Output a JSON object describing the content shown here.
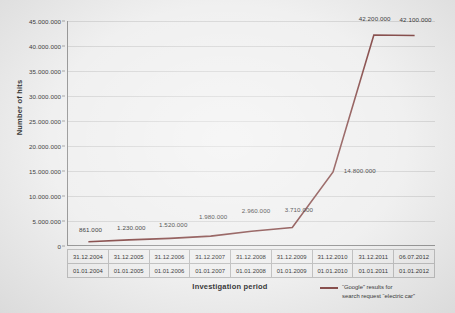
{
  "chart_data": {
    "type": "line",
    "title": "",
    "xlabel": "Investigation period",
    "ylabel": "Number of hits",
    "ylim": [
      0,
      45000000
    ],
    "ytick_step": 5000000,
    "grid": true,
    "legend_position": "bottom-right",
    "line_color": "#7b3a38",
    "categories": [
      "31.12.2004 / 01.01.2004",
      "31.12.2005 / 01.01.2005",
      "31.12.2006 / 01.01.2006",
      "31.12.2007 / 01.01.2007",
      "31.12.2008 / 01.01.2008",
      "31.12.2009 / 01.01.2009",
      "31.12.2010 / 01.01.2010",
      "31.12.2011 / 01.01.2011",
      "06.07.2012 / 01.01.2012"
    ],
    "category_rows": {
      "end_dates": [
        "31.12.2004",
        "31.12.2005",
        "31.12.2006",
        "31.12.2007",
        "31.12.2008",
        "31.12.2009",
        "31.12.2010",
        "31.12.2011",
        "06.07.2012"
      ],
      "start_dates": [
        "01.01.2004",
        "01.01.2005",
        "01.01.2006",
        "01.01.2007",
        "01.01.2008",
        "01.01.2009",
        "01.01.2010",
        "01.01.2011",
        "01.01.2012"
      ]
    },
    "series": [
      {
        "name": "“Google” results for search request “electric car”",
        "values": [
          861000,
          1230000,
          1520000,
          1980000,
          2960000,
          3710000,
          14800000,
          42200000,
          42100000
        ],
        "labels": [
          "861.000",
          "1.230.000",
          "1.520.000",
          "1.980.000",
          "2.960.000",
          "3.710.000",
          "14.800.000",
          "42.200.000",
          "42.100.000"
        ]
      }
    ],
    "ytick_labels": [
      "0",
      "5.000.000",
      "10.000.000",
      "15.000.000",
      "20.000.000",
      "25.000.000",
      "30.000.000",
      "35.000.000",
      "40.000.000",
      "45.000.000"
    ]
  },
  "axes": {
    "y_title": "Number of hits",
    "x_title": "Investigation period"
  },
  "legend": {
    "line1": "“Google” results for",
    "line2": "search request “electric car”"
  }
}
